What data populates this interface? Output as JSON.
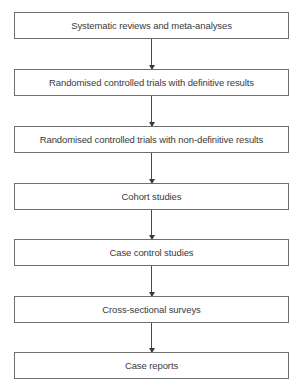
{
  "diagram": {
    "type": "flowchart",
    "orientation": "top-to-bottom",
    "nodes": [
      {
        "label": "Systematic reviews and meta-analyses"
      },
      {
        "label": "Randomised controlled trials with definitive results"
      },
      {
        "label": "Randomised controlled trials with non-definitive results"
      },
      {
        "label": "Cohort studies"
      },
      {
        "label": "Case control studies"
      },
      {
        "label": "Cross-sectional surveys"
      },
      {
        "label": "Case reports"
      }
    ],
    "edges": [
      {
        "from": 0,
        "to": 1
      },
      {
        "from": 1,
        "to": 2
      },
      {
        "from": 2,
        "to": 3
      },
      {
        "from": 3,
        "to": 4
      },
      {
        "from": 4,
        "to": 5
      },
      {
        "from": 5,
        "to": 6
      }
    ],
    "colors": {
      "border": "#6e6e6e",
      "text": "#3a3a3a",
      "arrow": "#4a4a4a",
      "background": "#ffffff"
    }
  }
}
